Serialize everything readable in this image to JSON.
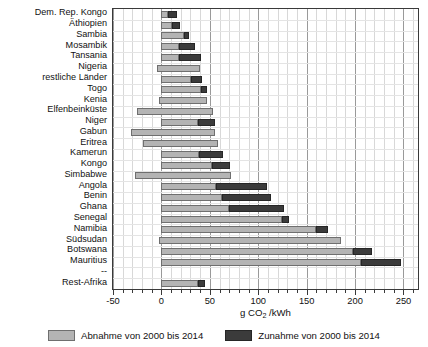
{
  "chart_data": {
    "type": "bar",
    "orientation": "horizontal",
    "stacked": true,
    "title": "",
    "xlabel": "g CO2 /kWh",
    "xlabel_parts": {
      "pre": "g CO",
      "sub": "2",
      "post": " /kWh"
    },
    "ylabel": "",
    "xlim": [
      -50,
      265
    ],
    "xticks": [
      -50,
      0,
      50,
      100,
      150,
      200,
      250
    ],
    "xticklabels": [
      "-50",
      "0",
      "50",
      "100",
      "150",
      "200",
      "250"
    ],
    "minor_tick_step": 10,
    "grid": true,
    "legend_position": "bottom",
    "colors": {
      "decrease": "#b4b4b4",
      "increase": "#3b3b3b",
      "decrease_edge": "#6f6f6f",
      "increase_edge": "#262626"
    },
    "series": [
      {
        "name": "Abnahme von 2000 bis 2014",
        "key": "decrease"
      },
      {
        "name": "Zunahme von 2000 bis 2014",
        "key": "increase"
      }
    ],
    "categories": [
      "Dem. Rep. Kongo",
      "Äthiopien",
      "Sambia",
      "Mosambik",
      "Tansania",
      "Nigeria",
      "restliche Länder",
      "Togo",
      "Kenia",
      "Elfenbeinküste",
      "Niger",
      "Gabun",
      "Eritrea",
      "Kamerun",
      "Kongo",
      "Simbabwe",
      "Angola",
      "Benin",
      "Ghana",
      "Senegal",
      "Namibia",
      "Südsudan",
      "Botswana",
      "Mauritius",
      "--",
      "Rest-Afrika"
    ],
    "bars": [
      {
        "category": "Dem. Rep. Kongo",
        "start": 0,
        "decrease_end": 7,
        "increase_end": 16
      },
      {
        "category": "Äthiopien",
        "start": 0,
        "decrease_end": 11,
        "increase_end": 19
      },
      {
        "category": "Sambia",
        "start": 0,
        "decrease_end": 23,
        "increase_end": 28
      },
      {
        "category": "Mosambik",
        "start": 0,
        "decrease_end": 18,
        "increase_end": 35
      },
      {
        "category": "Tansania",
        "start": 0,
        "decrease_end": 18,
        "increase_end": 41
      },
      {
        "category": "Nigeria",
        "start": -5,
        "decrease_end": 40,
        "increase_end": 40
      },
      {
        "category": "restliche Länder",
        "start": 0,
        "decrease_end": 31,
        "increase_end": 42
      },
      {
        "category": "Togo",
        "start": 0,
        "decrease_end": 41,
        "increase_end": 47
      },
      {
        "category": "Kenia",
        "start": -3,
        "decrease_end": 47,
        "increase_end": 47
      },
      {
        "category": "Elfenbeinküste",
        "start": -25,
        "decrease_end": 53,
        "increase_end": 53
      },
      {
        "category": "Niger",
        "start": 0,
        "decrease_end": 38,
        "increase_end": 55
      },
      {
        "category": "Gabun",
        "start": -31,
        "decrease_end": 55,
        "increase_end": 55
      },
      {
        "category": "Eritrea",
        "start": -19,
        "decrease_end": 58,
        "increase_end": 58
      },
      {
        "category": "Kamerun",
        "start": 0,
        "decrease_end": 39,
        "increase_end": 64
      },
      {
        "category": "Kongo",
        "start": 0,
        "decrease_end": 52,
        "increase_end": 71
      },
      {
        "category": "Simbabwe",
        "start": -27,
        "decrease_end": 72,
        "increase_end": 72
      },
      {
        "category": "Angola",
        "start": 0,
        "decrease_end": 56,
        "increase_end": 109
      },
      {
        "category": "Benin",
        "start": 0,
        "decrease_end": 63,
        "increase_end": 113
      },
      {
        "category": "Ghana",
        "start": 0,
        "decrease_end": 70,
        "increase_end": 127
      },
      {
        "category": "Senegal",
        "start": 0,
        "decrease_end": 125,
        "increase_end": 132
      },
      {
        "category": "Namibia",
        "start": 0,
        "decrease_end": 160,
        "increase_end": 172
      },
      {
        "category": "Südsudan",
        "start": -3,
        "decrease_end": 185,
        "increase_end": 185
      },
      {
        "category": "Botswana",
        "start": 0,
        "decrease_end": 198,
        "increase_end": 218
      },
      {
        "category": "Mauritius",
        "start": 0,
        "decrease_end": 206,
        "increase_end": 247
      },
      {
        "category": "--",
        "start": 0,
        "decrease_end": 0,
        "increase_end": 0
      },
      {
        "category": "Rest-Afrika",
        "start": 0,
        "decrease_end": 38,
        "increase_end": 45
      }
    ]
  }
}
